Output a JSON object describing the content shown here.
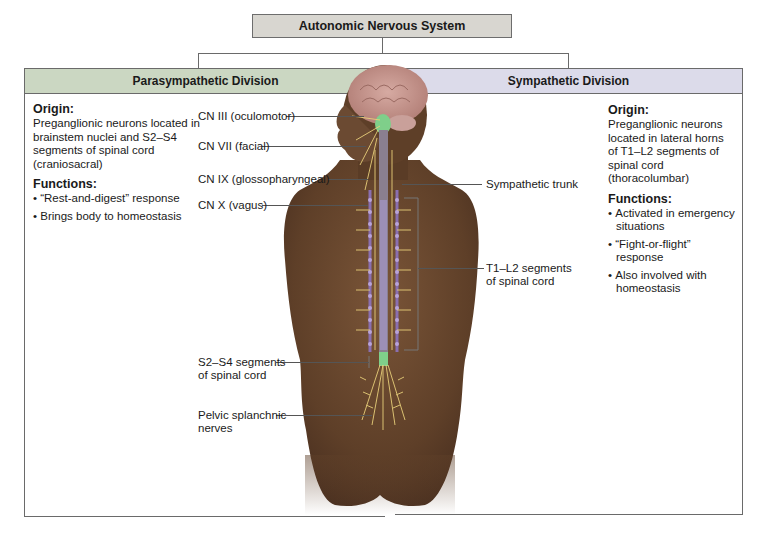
{
  "title": "Autonomic Nervous System",
  "divisions": {
    "parasympathetic": {
      "header": "Parasympathetic Division",
      "header_color": "#cbd7c2",
      "origin_heading": "Origin:",
      "origin_text": "Preganglionic neurons located in brainstem nuclei and S2–S4 segments of spinal cord (craniosacral)",
      "functions_heading": "Functions:",
      "functions": [
        "“Rest-and-digest” response",
        "Brings body to homeostasis"
      ]
    },
    "sympathetic": {
      "header": "Sympathetic Division",
      "header_color": "#dcdbea",
      "origin_heading": "Origin:",
      "origin_text": "Preganglionic neurons located in lateral horns of T1–L2 segments of spinal cord (thoracolumbar)",
      "functions_heading": "Functions:",
      "functions": [
        "Activated in emergency situations",
        "“Fight-or-flight” response",
        "Also involved with homeostasis"
      ]
    }
  },
  "labels": {
    "cn3": "CN III (oculomotor)",
    "cn7": "CN VII (facial)",
    "cn9": "CN IX (glossopharyngeal)",
    "cn10": "CN X (vagus)",
    "s2s4_line1": "S2–S4 segments",
    "s2s4_line2": "of spinal cord",
    "pelvic_line1": "Pelvic splanchnic",
    "pelvic_line2": "nerves",
    "symp_trunk": "Sympathetic trunk",
    "t1l2_line1": "T1–L2 segments",
    "t1l2_line2": "of spinal cord"
  },
  "colors": {
    "skin": "#6b4a32",
    "brain": "#c99a92",
    "spinal_cord_green": "#7fcf8a",
    "sympathetic_chain": "#8a6fb0",
    "nerves": "#e8cf7a"
  }
}
